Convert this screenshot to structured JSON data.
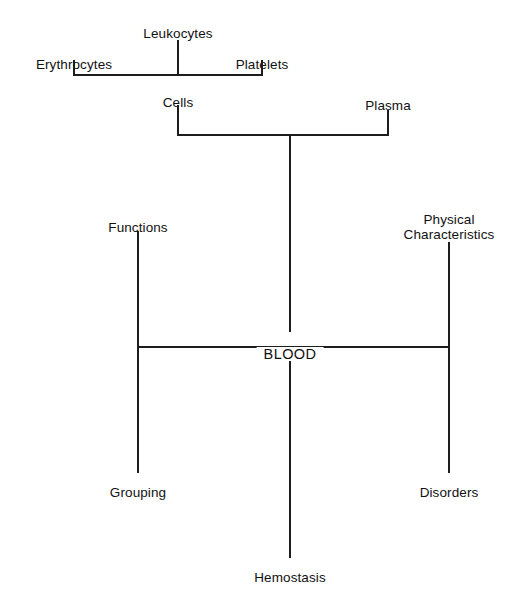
{
  "diagram": {
    "title": "BLOOD",
    "type": "concept-map",
    "root": {
      "label": "BLOOD",
      "x": 290,
      "y": 347
    },
    "nodes": [
      {
        "id": "leukocytes",
        "label": "Leukocytes",
        "x": 178,
        "y": 27,
        "align": "center",
        "level": 3
      },
      {
        "id": "erythrocytes",
        "label": "Erythrocytes",
        "x": 74,
        "y": 58,
        "align": "center",
        "level": 3
      },
      {
        "id": "platelets",
        "label": "Platelets",
        "x": 262,
        "y": 58,
        "align": "center",
        "level": 3
      },
      {
        "id": "cells",
        "label": "Cells",
        "x": 178,
        "y": 96,
        "align": "center",
        "level": 2
      },
      {
        "id": "plasma",
        "label": "Plasma",
        "x": 388,
        "y": 99,
        "align": "center",
        "level": 2
      },
      {
        "id": "functions",
        "label": "Functions",
        "x": 138,
        "y": 221,
        "align": "center",
        "level": 1
      },
      {
        "id": "physical-characteristics",
        "label": "Physical\nCharacteristics",
        "x": 449,
        "y": 212,
        "align": "center",
        "level": 1
      },
      {
        "id": "grouping",
        "label": "Grouping",
        "x": 138,
        "y": 486,
        "align": "center",
        "level": 1
      },
      {
        "id": "disorders",
        "label": "Disorders",
        "x": 449,
        "y": 486,
        "align": "center",
        "level": 1
      },
      {
        "id": "hemostasis",
        "label": "Hemostasis",
        "x": 290,
        "y": 571,
        "align": "center",
        "level": 1
      }
    ],
    "edges": [
      {
        "id": "leukocytes-stem",
        "from": "leukocytes",
        "to": "cells-bar",
        "orient": "v",
        "x": 178,
        "y1": 40,
        "y2": 76
      },
      {
        "id": "erythrocytes-stem",
        "from": "erythrocytes",
        "to": "cells-bar",
        "orient": "v",
        "x": 74,
        "y1": 60,
        "y2": 76
      },
      {
        "id": "platelets-stem",
        "from": "platelets",
        "to": "cells-bar",
        "orient": "v",
        "x": 262,
        "y1": 60,
        "y2": 76
      },
      {
        "id": "cells-bar",
        "from": "erythrocytes",
        "to": "platelets",
        "orient": "h",
        "y": 75,
        "x1": 74,
        "x2": 263
      },
      {
        "id": "cells-stem",
        "from": "cells",
        "to": "blood-bar-top",
        "orient": "v",
        "x": 178,
        "y1": 105,
        "y2": 136
      },
      {
        "id": "plasma-stem",
        "from": "plasma",
        "to": "blood-bar-top",
        "orient": "v",
        "x": 388,
        "y1": 110,
        "y2": 136
      },
      {
        "id": "blood-bar-top",
        "from": "cells",
        "to": "plasma",
        "orient": "h",
        "y": 135,
        "x1": 178,
        "x2": 389
      },
      {
        "id": "blood-stem-up",
        "from": "blood-bar-top",
        "to": "blood",
        "orient": "v",
        "x": 290,
        "y1": 135,
        "y2": 332
      },
      {
        "id": "blood-bar-main",
        "from": "functions",
        "to": "physical-characteristics",
        "orient": "h",
        "y": 347,
        "x1": 137,
        "x2": 450
      },
      {
        "id": "functions-stem",
        "from": "functions",
        "to": "grouping",
        "orient": "v",
        "x": 138,
        "y1": 231,
        "y2": 473
      },
      {
        "id": "physical-stem",
        "from": "physical-characteristics",
        "to": "disorders",
        "orient": "v",
        "x": 449,
        "y1": 242,
        "y2": 473
      },
      {
        "id": "blood-stem-down",
        "from": "blood",
        "to": "hemostasis",
        "orient": "v",
        "x": 290,
        "y1": 360,
        "y2": 558
      }
    ],
    "colors": {
      "line": "#1d1d1d",
      "text": "#111111",
      "background": "#ffffff"
    }
  }
}
